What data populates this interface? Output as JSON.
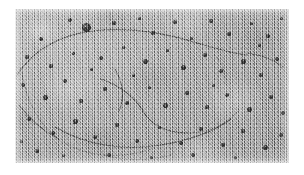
{
  "figure": {
    "kind": "electron-micrograph",
    "caption": "",
    "frame": {
      "canvas_width": 304,
      "canvas_height": 175,
      "image_left": 15,
      "image_top": 9,
      "image_width": 274,
      "image_height": 154,
      "mount_color": "#ffffff"
    },
    "tones": {
      "background_mid_gray": "#a6a6a6",
      "background_light_gray": "#d8d8d8",
      "background_dark_gray": "#6a6a6a",
      "particle_dark": "#141414",
      "filament_stroke": "#3b3b3b"
    },
    "filaments": [
      {
        "name": "upper-arc",
        "path": "M 2 66 C 18 42, 44 26, 78 22 C 112 18, 150 24, 182 34"
      },
      {
        "name": "upper-arc-tail",
        "path": "M 182 34 C 200 39, 214 44, 232 46"
      },
      {
        "name": "left-outer-loop",
        "path": "M 6 58 C 10 88, 22 116, 46 132 C 72 149, 108 150, 136 140"
      },
      {
        "name": "inner-loop-upper",
        "path": "M 86 70 C 104 76, 120 88, 128 102"
      },
      {
        "name": "inner-loop-lower",
        "path": "M 128 102 C 136 116, 152 124, 172 124"
      },
      {
        "name": "inner-loop-return",
        "path": "M 172 124 C 196 124, 214 114, 224 100"
      },
      {
        "name": "mid-diagonal",
        "path": "M 100 60 C 108 74, 110 88, 104 102"
      },
      {
        "name": "lower-sweep",
        "path": "M 40 118 C 70 136, 108 142, 146 136 C 176 131, 200 122, 216 110"
      },
      {
        "name": "right-short",
        "path": "M 200 46 C 208 56, 212 66, 210 76"
      },
      {
        "name": "right-wisp",
        "path": "M 232 44 C 246 46, 258 50, 268 58"
      },
      {
        "name": "left-wisp",
        "path": "M 4 96 C 14 110, 28 122, 44 130"
      },
      {
        "name": "bottom-wisp",
        "path": "M 88 146 C 110 152, 134 152, 156 146"
      }
    ],
    "particles": [
      {
        "x": 71,
        "y": 18,
        "d": 9
      },
      {
        "x": 26,
        "y": 30,
        "d": 4
      },
      {
        "x": 55,
        "y": 11,
        "d": 4
      },
      {
        "x": 99,
        "y": 14,
        "d": 4
      },
      {
        "x": 124,
        "y": 9,
        "d": 3
      },
      {
        "x": 138,
        "y": 24,
        "d": 4
      },
      {
        "x": 160,
        "y": 13,
        "d": 4
      },
      {
        "x": 176,
        "y": 29,
        "d": 3
      },
      {
        "x": 196,
        "y": 12,
        "d": 4
      },
      {
        "x": 214,
        "y": 25,
        "d": 4
      },
      {
        "x": 236,
        "y": 14,
        "d": 3
      },
      {
        "x": 253,
        "y": 27,
        "d": 4
      },
      {
        "x": 266,
        "y": 9,
        "d": 3
      },
      {
        "x": 12,
        "y": 48,
        "d": 4
      },
      {
        "x": 36,
        "y": 57,
        "d": 4
      },
      {
        "x": 58,
        "y": 44,
        "d": 3
      },
      {
        "x": 86,
        "y": 49,
        "d": 4
      },
      {
        "x": 108,
        "y": 38,
        "d": 3
      },
      {
        "x": 130,
        "y": 52,
        "d": 5
      },
      {
        "x": 152,
        "y": 41,
        "d": 3
      },
      {
        "x": 168,
        "y": 58,
        "d": 5
      },
      {
        "x": 190,
        "y": 46,
        "d": 4
      },
      {
        "x": 206,
        "y": 62,
        "d": 4
      },
      {
        "x": 228,
        "y": 52,
        "d": 5
      },
      {
        "x": 246,
        "y": 66,
        "d": 4
      },
      {
        "x": 262,
        "y": 50,
        "d": 4
      },
      {
        "x": 8,
        "y": 76,
        "d": 4
      },
      {
        "x": 30,
        "y": 88,
        "d": 5
      },
      {
        "x": 50,
        "y": 72,
        "d": 4
      },
      {
        "x": 66,
        "y": 92,
        "d": 4
      },
      {
        "x": 90,
        "y": 80,
        "d": 4
      },
      {
        "x": 112,
        "y": 94,
        "d": 4
      },
      {
        "x": 134,
        "y": 78,
        "d": 3
      },
      {
        "x": 150,
        "y": 96,
        "d": 5
      },
      {
        "x": 172,
        "y": 84,
        "d": 4
      },
      {
        "x": 192,
        "y": 98,
        "d": 4
      },
      {
        "x": 212,
        "y": 86,
        "d": 4
      },
      {
        "x": 234,
        "y": 100,
        "d": 5
      },
      {
        "x": 256,
        "y": 88,
        "d": 4
      },
      {
        "x": 268,
        "y": 104,
        "d": 4
      },
      {
        "x": 14,
        "y": 110,
        "d": 4
      },
      {
        "x": 38,
        "y": 124,
        "d": 4
      },
      {
        "x": 60,
        "y": 112,
        "d": 5
      },
      {
        "x": 80,
        "y": 128,
        "d": 4
      },
      {
        "x": 102,
        "y": 116,
        "d": 4
      },
      {
        "x": 122,
        "y": 132,
        "d": 4
      },
      {
        "x": 144,
        "y": 118,
        "d": 3
      },
      {
        "x": 166,
        "y": 134,
        "d": 4
      },
      {
        "x": 186,
        "y": 120,
        "d": 4
      },
      {
        "x": 208,
        "y": 136,
        "d": 4
      },
      {
        "x": 228,
        "y": 122,
        "d": 4
      },
      {
        "x": 250,
        "y": 138,
        "d": 5
      },
      {
        "x": 266,
        "y": 126,
        "d": 4
      },
      {
        "x": 22,
        "y": 142,
        "d": 4
      },
      {
        "x": 48,
        "y": 146,
        "d": 3
      },
      {
        "x": 94,
        "y": 146,
        "d": 4
      },
      {
        "x": 136,
        "y": 148,
        "d": 3
      },
      {
        "x": 178,
        "y": 146,
        "d": 4
      },
      {
        "x": 220,
        "y": 148,
        "d": 3
      },
      {
        "x": 6,
        "y": 132,
        "d": 3
      },
      {
        "x": 118,
        "y": 66,
        "d": 3
      },
      {
        "x": 76,
        "y": 60,
        "d": 3
      },
      {
        "x": 244,
        "y": 36,
        "d": 3
      },
      {
        "x": 198,
        "y": 76,
        "d": 3
      }
    ]
  }
}
